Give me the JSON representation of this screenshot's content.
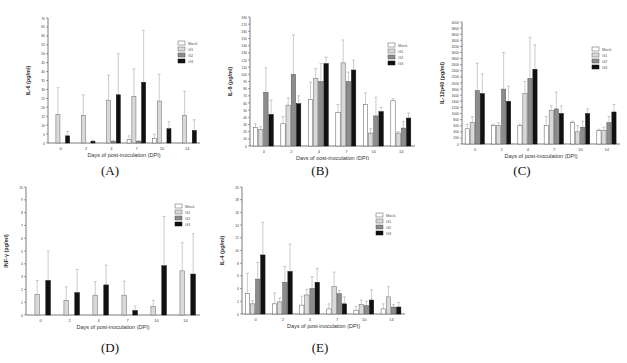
{
  "legend": [
    {
      "name": "Mock",
      "fill": "#ffffff",
      "stroke": "#555555"
    },
    {
      "name": "G1",
      "fill": "#d9d9d9",
      "stroke": "#666666"
    },
    {
      "name": "G2",
      "fill": "#8c8c8c",
      "stroke": "#555555"
    },
    {
      "name": "G3",
      "fill": "#111111",
      "stroke": "#111111"
    }
  ],
  "panels": [
    {
      "id": "A",
      "label": "(A)"
    },
    {
      "id": "B",
      "label": "(B)"
    },
    {
      "id": "C",
      "label": "(C)"
    },
    {
      "id": "D",
      "label": "(D)"
    },
    {
      "id": "E",
      "label": "(E)"
    }
  ],
  "chart_data": [
    {
      "panel": "A",
      "type": "bar",
      "title": "",
      "xlabel": "Days of post-inoculation (DPI)",
      "ylabel": "IL-6 (pg/ml)",
      "categories": [
        "0",
        "2",
        "4",
        "7",
        "10",
        "14"
      ],
      "ylim": [
        0,
        70
      ],
      "ytick_step": 5,
      "grid": false,
      "legend_position": "upper right",
      "series": [
        {
          "name": "Mock",
          "values": [
            0,
            0,
            0,
            2,
            2.5,
            0
          ],
          "errors": [
            0,
            0,
            0,
            2,
            2.5,
            0
          ]
        },
        {
          "name": "G1",
          "values": [
            16,
            15.5,
            24,
            26,
            23.5,
            15.5
          ],
          "errors": [
            15,
            11.5,
            14,
            15.5,
            15,
            13.5
          ]
        },
        {
          "name": "G2",
          "values": [
            0,
            0,
            1,
            1,
            0,
            0
          ],
          "errors": [
            0,
            0,
            0.5,
            0.5,
            0,
            0
          ]
        },
        {
          "name": "G3",
          "values": [
            4,
            1,
            27,
            34,
            8,
            7
          ],
          "errors": [
            2.5,
            0.5,
            23,
            29,
            4,
            6
          ]
        }
      ]
    },
    {
      "panel": "B",
      "type": "bar",
      "title": "",
      "xlabel": "Days of post-inoculation (DPI)",
      "ylabel": "IL-8 (pg/ml)",
      "categories": [
        "0",
        "2",
        "4",
        "7",
        "10",
        "14"
      ],
      "ylim": [
        0,
        180
      ],
      "ytick_step": 10,
      "grid": false,
      "legend_position": "upper right",
      "series": [
        {
          "name": "Mock",
          "values": [
            26,
            31,
            65,
            47,
            58,
            63
          ],
          "errors": [
            5,
            10,
            24,
            11,
            16,
            3
          ]
        },
        {
          "name": "G1",
          "values": [
            23,
            57,
            94,
            116,
            18,
            18
          ],
          "errors": [
            4,
            10,
            14,
            32,
            6,
            2
          ]
        },
        {
          "name": "G2",
          "values": [
            75,
            100,
            90,
            90,
            42,
            25
          ],
          "errors": [
            34,
            55,
            25,
            13,
            26,
            9
          ]
        },
        {
          "name": "G3",
          "values": [
            44,
            59,
            115,
            106,
            48,
            39
          ],
          "errors": [
            20,
            11,
            9,
            14,
            6,
            7
          ]
        }
      ]
    },
    {
      "panel": "C",
      "type": "bar",
      "title": "",
      "xlabel": "Days of post-inoculation (DPI)",
      "ylabel": "IL-12p40 (pg/ml)",
      "categories": [
        "0",
        "2",
        "4",
        "7",
        "10",
        "14"
      ],
      "ylim": [
        0,
        4000
      ],
      "ytick_step": 200,
      "grid": false,
      "legend_position": "upper right",
      "series": [
        {
          "name": "Mock",
          "values": [
            500,
            600,
            600,
            600,
            700,
            450
          ],
          "errors": [
            150,
            50,
            50,
            300,
            50,
            30
          ]
        },
        {
          "name": "G1",
          "values": [
            700,
            600,
            1650,
            1100,
            400,
            450
          ],
          "errors": [
            200,
            100,
            400,
            150,
            200,
            100
          ]
        },
        {
          "name": "G2",
          "values": [
            1750,
            1800,
            2150,
            1150,
            550,
            700
          ],
          "errors": [
            900,
            1200,
            1350,
            550,
            200,
            200
          ]
        },
        {
          "name": "G3",
          "values": [
            1650,
            1400,
            2450,
            1000,
            1000,
            1050
          ],
          "errors": [
            650,
            500,
            800,
            250,
            150,
            250
          ]
        }
      ]
    },
    {
      "panel": "D",
      "type": "bar",
      "title": "",
      "xlabel": "Days of post-inoculation (DPI)",
      "ylabel": "INF-γ (pg/ml)",
      "categories": [
        "0",
        "2",
        "4",
        "7",
        "10",
        "14"
      ],
      "ylim": [
        0,
        10
      ],
      "ytick_step": 1,
      "grid": false,
      "legend_position": "upper right",
      "series": [
        {
          "name": "Mock",
          "values": [
            0,
            0,
            0,
            0,
            0,
            0
          ],
          "errors": [
            0,
            0,
            0,
            0,
            0,
            0
          ]
        },
        {
          "name": "G1",
          "values": [
            1.6,
            1.15,
            1.55,
            1.55,
            0.65,
            3.45
          ],
          "errors": [
            1.1,
            1.05,
            1.05,
            1.1,
            0.5,
            2.2
          ]
        },
        {
          "name": "G2",
          "values": [
            0,
            0,
            0,
            0,
            0,
            0
          ],
          "errors": [
            0,
            0,
            0,
            0,
            0,
            0
          ]
        },
        {
          "name": "G3",
          "values": [
            2.7,
            1.75,
            2.35,
            0.35,
            3.85,
            3.2
          ],
          "errors": [
            2.3,
            1.8,
            1.55,
            0.35,
            3.85,
            3.15
          ]
        }
      ]
    },
    {
      "panel": "E",
      "type": "bar",
      "title": "",
      "xlabel": "Days of post-inoculation (DPI)",
      "ylabel": "IL-4 (pg/ml)",
      "categories": [
        "0",
        "2",
        "4",
        "7",
        "10",
        "14"
      ],
      "ylim": [
        0,
        20
      ],
      "ytick_step": 2,
      "grid": false,
      "legend_position": "upper right",
      "series": [
        {
          "name": "Mock",
          "values": [
            3.2,
            1.6,
            1.4,
            0.8,
            0.6,
            0.8
          ],
          "errors": [
            3.2,
            1.7,
            1.4,
            0.8,
            0.6,
            0.8
          ]
        },
        {
          "name": "G1",
          "values": [
            1.6,
            1.9,
            3.0,
            4.3,
            1.5,
            2.7
          ],
          "errors": [
            0.5,
            0.6,
            0.9,
            2.3,
            0.7,
            1.6
          ]
        },
        {
          "name": "G2",
          "values": [
            5.5,
            5.0,
            4.0,
            3.2,
            1.3,
            1.1
          ],
          "errors": [
            2.6,
            2.5,
            1.9,
            0.5,
            0.7,
            0.4
          ]
        },
        {
          "name": "G3",
          "values": [
            9.3,
            6.7,
            5.0,
            1.6,
            2.2,
            1.1
          ],
          "errors": [
            5.1,
            4.3,
            2.2,
            1.1,
            1.6,
            0.7
          ]
        }
      ]
    }
  ]
}
